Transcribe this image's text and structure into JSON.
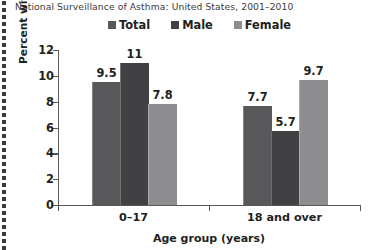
{
  "chart_data": {
    "type": "bar",
    "title": "National Surveillance of Asthma: United States, 2001–2010",
    "xlabel": "Age group (years)",
    "ylabel": "Percent with asthma",
    "categories": [
      "0–17",
      "18 and over"
    ],
    "series": [
      {
        "name": "Total",
        "values": [
          9.5,
          7.7
        ],
        "labels": [
          "9.5",
          "7.7"
        ],
        "color": "#58585a"
      },
      {
        "name": "Male",
        "values": [
          11,
          5.7
        ],
        "labels": [
          "11",
          "5.7"
        ],
        "color": "#414042"
      },
      {
        "name": "Female",
        "values": [
          7.8,
          9.7
        ],
        "labels": [
          "7.8",
          "9.7"
        ],
        "color": "#8d8d8f"
      }
    ],
    "ylim": [
      0,
      12
    ],
    "yticks": [
      0,
      2,
      4,
      6,
      8,
      10,
      12
    ],
    "ytick_labels": [
      "0",
      "2",
      "4",
      "6",
      "8",
      "10",
      "12"
    ],
    "grid": false,
    "legend_position": "top"
  },
  "legend": {
    "items": [
      {
        "label": "Total",
        "swatch": "legend-swatch-total"
      },
      {
        "label": "Male",
        "swatch": "legend-swatch-male"
      },
      {
        "label": "Female",
        "swatch": "legend-swatch-female"
      }
    ]
  },
  "colors": {
    "total": "#58585a",
    "male": "#414042",
    "female": "#8d8d8f",
    "axis": "#58585a",
    "text": "#231f20",
    "title_text": "#3a3a3c",
    "background": "#ffffff",
    "perforation": "#3b3b3b"
  },
  "artifact": {
    "perforation_dot_name": "page-perforation-dot",
    "perforation_dot_count": 36
  }
}
